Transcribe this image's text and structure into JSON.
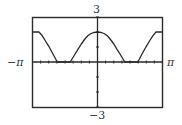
{
  "chart_data": {
    "type": "line",
    "title": "",
    "xlabel": "",
    "ylabel": "",
    "xlim": [
      -3.14159,
      3.14159
    ],
    "ylim": [
      -3,
      3
    ],
    "x_tick_labels": {
      "min": "−π",
      "max": "π"
    },
    "y_tick_labels": {
      "min": "−3",
      "max": "3"
    },
    "x_ticks_per_pi": 8,
    "y_tick_step": 1,
    "grid": false,
    "legend": null,
    "series": [
      {
        "name": "f(x)",
        "x_over_pi": [
          -1.0,
          -0.9,
          -0.85,
          -0.8,
          -0.75,
          -0.7,
          -0.65,
          -0.62,
          -0.55,
          -0.5,
          -0.45,
          -0.42,
          -0.35,
          -0.3,
          -0.25,
          -0.2,
          -0.15,
          -0.1,
          -0.05,
          0.0,
          0.05,
          0.1,
          0.15,
          0.2,
          0.25,
          0.3,
          0.35,
          0.42,
          0.45,
          0.5,
          0.55,
          0.62,
          0.65,
          0.7,
          0.75,
          0.8,
          0.85,
          0.9,
          1.0
        ],
        "y": [
          2.0,
          2.0,
          1.75,
          1.4,
          1.05,
          0.65,
          0.25,
          0.0,
          0.0,
          0.0,
          0.0,
          0.0,
          0.5,
          0.85,
          1.2,
          1.5,
          1.75,
          1.9,
          1.98,
          2.0,
          1.98,
          1.9,
          1.75,
          1.5,
          1.2,
          0.85,
          0.5,
          0.0,
          0.0,
          0.0,
          0.0,
          0.0,
          0.25,
          0.65,
          1.05,
          1.4,
          1.75,
          2.0,
          2.0
        ]
      }
    ]
  },
  "labels": {
    "y_max": "3",
    "y_min": "−3",
    "x_min": "−π",
    "x_max": "π"
  },
  "colors": {
    "frame": "#2a2a2a",
    "curve": "#2a2a2a",
    "axis": "#2a2a2a",
    "background": "#ffffff"
  }
}
